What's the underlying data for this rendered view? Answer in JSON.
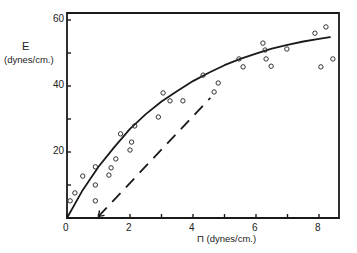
{
  "chart_data": {
    "type": "scatter",
    "title": "",
    "xlabel": "Π (dynes/cm.)",
    "ylabel_symbol": "E",
    "ylabel_units": "(dynes/cm.)",
    "xlim": [
      0,
      8.6
    ],
    "ylim": [
      0,
      62
    ],
    "x_ticks": [
      0,
      1,
      2,
      3,
      4,
      5,
      6,
      7,
      8
    ],
    "x_tick_labels": [
      "0",
      "2",
      "4",
      "6",
      "8"
    ],
    "x_tick_label_values": [
      0,
      2,
      4,
      6,
      8
    ],
    "y_ticks": [
      0,
      10,
      20,
      30,
      40,
      50,
      60
    ],
    "y_tick_labels": [
      "20",
      "40",
      "60"
    ],
    "y_tick_label_values": [
      20,
      40,
      60
    ],
    "grid": false,
    "series": [
      {
        "name": "measured points",
        "style": "open-circle",
        "points": [
          [
            0.1,
            5.2
          ],
          [
            0.25,
            7.6
          ],
          [
            0.5,
            12.7
          ],
          [
            0.9,
            15.5
          ],
          [
            0.9,
            10.0
          ],
          [
            0.9,
            5.2
          ],
          [
            1.33,
            13.0
          ],
          [
            1.4,
            15.2
          ],
          [
            1.55,
            17.9
          ],
          [
            1.7,
            25.5
          ],
          [
            2.0,
            20.6
          ],
          [
            2.05,
            23.0
          ],
          [
            2.15,
            27.9
          ],
          [
            2.9,
            30.6
          ],
          [
            3.05,
            37.9
          ],
          [
            3.27,
            35.5
          ],
          [
            3.68,
            35.5
          ],
          [
            4.32,
            43.3
          ],
          [
            4.67,
            38.2
          ],
          [
            4.8,
            40.9
          ],
          [
            5.46,
            48.2
          ],
          [
            5.59,
            45.8
          ],
          [
            6.22,
            53.0
          ],
          [
            6.29,
            50.9
          ],
          [
            6.32,
            48.2
          ],
          [
            6.48,
            46.0
          ],
          [
            6.98,
            51.2
          ],
          [
            7.87,
            56.0
          ],
          [
            8.22,
            57.9
          ],
          [
            8.06,
            45.8
          ],
          [
            8.44,
            48.2
          ]
        ]
      },
      {
        "name": "fitted curve",
        "style": "solid",
        "points": [
          [
            0,
            0
          ],
          [
            0.5,
            8.5
          ],
          [
            1,
            15.5
          ],
          [
            1.5,
            21.5
          ],
          [
            2,
            27
          ],
          [
            2.5,
            31.5
          ],
          [
            3,
            35.3
          ],
          [
            3.5,
            38.5
          ],
          [
            4,
            41.5
          ],
          [
            4.5,
            44
          ],
          [
            5,
            46.3
          ],
          [
            5.5,
            48.2
          ],
          [
            6,
            49.8
          ],
          [
            6.5,
            51.3
          ],
          [
            7,
            52.5
          ],
          [
            7.5,
            53.5
          ],
          [
            8,
            54.3
          ],
          [
            8.35,
            54.8
          ]
        ]
      },
      {
        "name": "dashed line",
        "style": "dashed",
        "points": [
          [
            1.0,
            0.5
          ],
          [
            4.55,
            36.4
          ]
        ]
      }
    ]
  }
}
